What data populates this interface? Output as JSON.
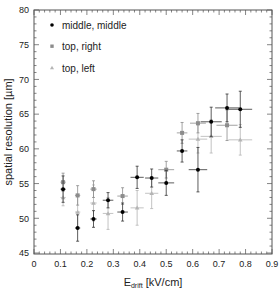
{
  "chart_data": {
    "type": "scatter",
    "title": "",
    "xlabel": "E",
    "xlabel_sub": "drift",
    "xlabel_unit": " [kV/cm]",
    "ylabel": "spatial resolution [µm]",
    "xlim": [
      0,
      0.9
    ],
    "ylim": [
      45,
      80
    ],
    "x_ticks": [
      0,
      0.1,
      0.2,
      0.3,
      0.4,
      0.5,
      0.6,
      0.7,
      0.8,
      0.9
    ],
    "x_tick_labels": [
      "0",
      "0.1",
      "0.2",
      "0.3",
      "0.4",
      "0.5",
      "0.6",
      "0.7",
      "0.8",
      "0.9"
    ],
    "y_ticks": [
      45,
      50,
      55,
      60,
      65,
      70,
      75,
      80
    ],
    "y_tick_labels": [
      "45",
      "50",
      "55",
      "60",
      "65",
      "70",
      "75",
      "80"
    ],
    "grid": false,
    "legend_position": "upper left",
    "series": [
      {
        "name": "middle, middle",
        "marker": "circle",
        "color": "#000000",
        "points": [
          {
            "x": 0.11,
            "y": 54.2,
            "ex": 0.01,
            "ey": 1.9
          },
          {
            "x": 0.165,
            "y": 48.6,
            "ex": 0.01,
            "ey": 1.9
          },
          {
            "x": 0.225,
            "y": 49.9,
            "ex": 0.012,
            "ey": 1.2
          },
          {
            "x": 0.28,
            "y": 52.6,
            "ex": 0.02,
            "ey": 1.1
          },
          {
            "x": 0.335,
            "y": 50.9,
            "ex": 0.02,
            "ey": 1.3
          },
          {
            "x": 0.39,
            "y": 55.9,
            "ex": 0.025,
            "ey": 1.6
          },
          {
            "x": 0.445,
            "y": 55.8,
            "ex": 0.025,
            "ey": 1.3
          },
          {
            "x": 0.5,
            "y": 55.1,
            "ex": 0.03,
            "ey": 1.8
          },
          {
            "x": 0.56,
            "y": 59.7,
            "ex": 0.02,
            "ey": 1.6
          },
          {
            "x": 0.62,
            "y": 57.0,
            "ex": 0.035,
            "ey": 3.2
          },
          {
            "x": 0.67,
            "y": 63.9,
            "ex": 0.04,
            "ey": 2.1
          },
          {
            "x": 0.73,
            "y": 65.9,
            "ex": 0.045,
            "ey": 2.0
          },
          {
            "x": 0.78,
            "y": 65.7,
            "ex": 0.045,
            "ey": 2.6
          }
        ]
      },
      {
        "name": "top, right",
        "marker": "square",
        "color": "#8c8c8c",
        "points": [
          {
            "x": 0.11,
            "y": 55.2,
            "ex": 0.01,
            "ey": 1.3
          },
          {
            "x": 0.165,
            "y": 53.3,
            "ex": 0.01,
            "ey": 1.4
          },
          {
            "x": 0.225,
            "y": 54.2,
            "ex": 0.012,
            "ey": 1.2
          },
          {
            "x": 0.335,
            "y": 53.2,
            "ex": 0.02,
            "ey": 1.2
          },
          {
            "x": 0.5,
            "y": 57.0,
            "ex": 0.03,
            "ey": 1.2
          },
          {
            "x": 0.56,
            "y": 62.3,
            "ex": 0.02,
            "ey": 1.5
          },
          {
            "x": 0.62,
            "y": 63.7,
            "ex": 0.03,
            "ey": 1.4
          },
          {
            "x": 0.73,
            "y": 63.4,
            "ex": 0.04,
            "ey": 2.2
          }
        ]
      },
      {
        "name": "top, left",
        "marker": "triangle",
        "color": "#b4b4b4",
        "points": [
          {
            "x": 0.11,
            "y": 53.0,
            "ex": 0.01,
            "ey": 1.2
          },
          {
            "x": 0.165,
            "y": 50.9,
            "ex": 0.01,
            "ey": 2.2
          },
          {
            "x": 0.225,
            "y": 52.2,
            "ex": 0.012,
            "ey": 2.6
          },
          {
            "x": 0.28,
            "y": 50.7,
            "ex": 0.02,
            "ey": 2.3
          },
          {
            "x": 0.39,
            "y": 51.5,
            "ex": 0.025,
            "ey": 2.5
          },
          {
            "x": 0.445,
            "y": 53.6,
            "ex": 0.025,
            "ey": 2.2
          },
          {
            "x": 0.62,
            "y": 61.4,
            "ex": 0.035,
            "ey": 2.0
          },
          {
            "x": 0.67,
            "y": 61.8,
            "ex": 0.04,
            "ey": 2.4
          },
          {
            "x": 0.78,
            "y": 61.3,
            "ex": 0.045,
            "ey": 2.2
          }
        ]
      }
    ]
  },
  "legend": {
    "items": [
      {
        "label": "middle, middle"
      },
      {
        "label": "top, right"
      },
      {
        "label": "top, left"
      }
    ]
  },
  "axes": {
    "x_label_main": "E",
    "x_label_sub": "drift",
    "x_label_unit": " [kV/cm]",
    "y_label": "spatial resolution [µm]"
  }
}
